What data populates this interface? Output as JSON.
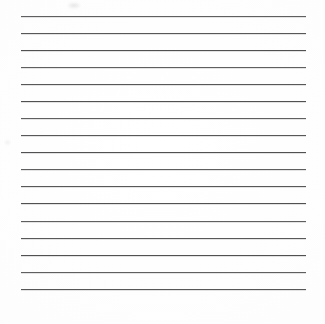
{
  "document": {
    "kind": "ruled-paper-scan",
    "title": "Blank ruled writing sheet",
    "body_text": "",
    "page_width": 325,
    "page_height": 324,
    "background_color": "#fefefe",
    "paper_tone_color": "#fafafa"
  },
  "ruling": {
    "line_color": "#4a4a4d",
    "line_thickness": 1,
    "line_count": 17,
    "left_margin_x": 21,
    "right_margin_x": 306,
    "line_length": 285,
    "first_line_y": 16,
    "last_line_y": 289,
    "line_spacing": 17.06,
    "lines_y": [
      16,
      33,
      50,
      67,
      84,
      101,
      118,
      135,
      152,
      169,
      186,
      203,
      221,
      238,
      255,
      272,
      289
    ]
  },
  "artifacts": {
    "smudge": {
      "name": "scan-smudge",
      "x": 67,
      "y": 2,
      "width": 14,
      "height": 7,
      "color": "#96969b"
    },
    "speck": {
      "name": "scan-speck-left",
      "x": 4,
      "y": 140,
      "width": 7,
      "height": 5,
      "color": "#a5a5aa"
    }
  }
}
